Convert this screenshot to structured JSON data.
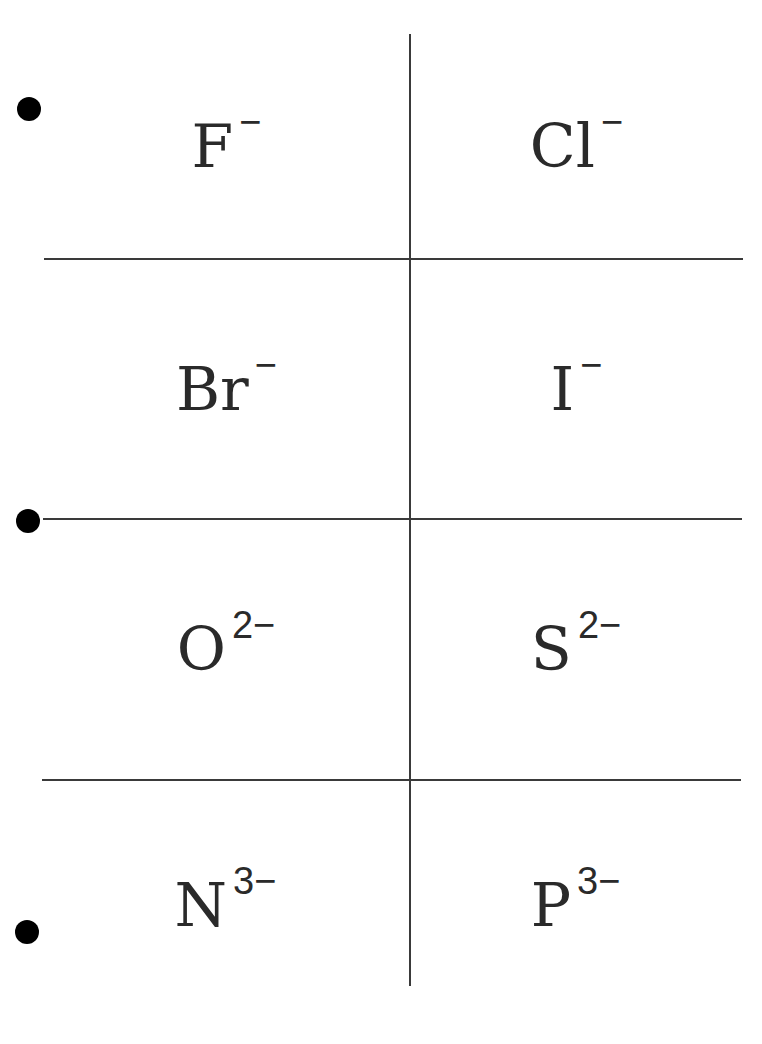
{
  "sheet": {
    "title": "Common anions flashcards",
    "cards": [
      {
        "symbol": "F",
        "charge": "−"
      },
      {
        "symbol": "Cl",
        "charge": "−"
      },
      {
        "symbol": "Br",
        "charge": "−"
      },
      {
        "symbol": "I",
        "charge": "−"
      },
      {
        "symbol": "O",
        "charge": "2−"
      },
      {
        "symbol": "S",
        "charge": "2−"
      },
      {
        "symbol": "N",
        "charge": "3−"
      },
      {
        "symbol": "P",
        "charge": "3−"
      }
    ],
    "colors": {
      "ink": "#2a2a2a",
      "line": "#3a3a3a",
      "hole": "#000000",
      "paper": "#ffffff"
    }
  }
}
